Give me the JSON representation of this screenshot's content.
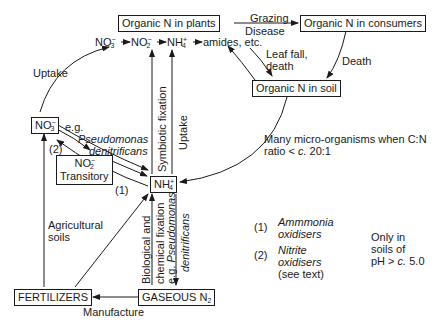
{
  "diagram": {
    "nodes": {
      "organic_n_plants": "Organic N in plants",
      "organic_n_consumers": "Organic N in consumers",
      "organic_n_soil": "Organic N in soil",
      "no3_box": {
        "base": "NO",
        "sub": "3",
        "sup": "−"
      },
      "no2_box": {
        "base": "NO",
        "sub": "2",
        "sup": "−",
        "line2": "Transitory"
      },
      "nh4_box": {
        "base": "NH",
        "sub": "4",
        "sup": "+"
      },
      "fertilizers": "FERTILIZERS",
      "gaseous_n2": {
        "base": "GASEOUS N",
        "sub": "2"
      }
    },
    "plant_chain": {
      "no3": {
        "base": "NO",
        "sub": "3",
        "sup": "−"
      },
      "no2": {
        "base": "NO",
        "sub": "2",
        "sup": "−"
      },
      "nh4": {
        "base": "NH",
        "sub": "4",
        "sup": "+"
      },
      "amides": "amides, etc."
    },
    "edge_labels": {
      "grazing": "Grazing",
      "disease": "Disease",
      "leaf_fall": "Leaf fall,",
      "death_leaf": "death",
      "death": "Death",
      "uptake_left": "Uptake",
      "eg": "e.g.",
      "pseudomonas": "Pseudomonas",
      "denitrificans": "denitrificans",
      "step2": "(2)",
      "step1": "(1)",
      "symbiotic": "Symbiotic fixation",
      "uptake_vertical": "Uptake",
      "micro_line1": "Many micro-organisms when C:N",
      "micro_line2_pre": "ratio < ",
      "micro_line2_c": "c.",
      "micro_line2_post": " 20:1",
      "agri_line1": "Agricultural",
      "agri_line2": "soils",
      "bio_fix_line1": "Biological and",
      "bio_fix_line2": "chemical fixation",
      "bio_fix_line3_pre": "e.g. ",
      "bio_fix_line3_it": "Pseudomonas",
      "bio_fix_line4": "denitrificans",
      "manufacture": "Manufacture"
    },
    "legend": {
      "item1_num": "(1)",
      "item1_line1": "Ammmonia",
      "item1_line2": "oxidisers",
      "item2_num": "(2)",
      "item2_line1": "Nitrite",
      "item2_line2": "oxidisers",
      "item2_line3": "(see text)",
      "note_line1": "Only in",
      "note_line2": "soils of",
      "note_line3_pre": "pH > ",
      "note_line3_c": "c.",
      "note_line3_post": " 5.0"
    }
  }
}
